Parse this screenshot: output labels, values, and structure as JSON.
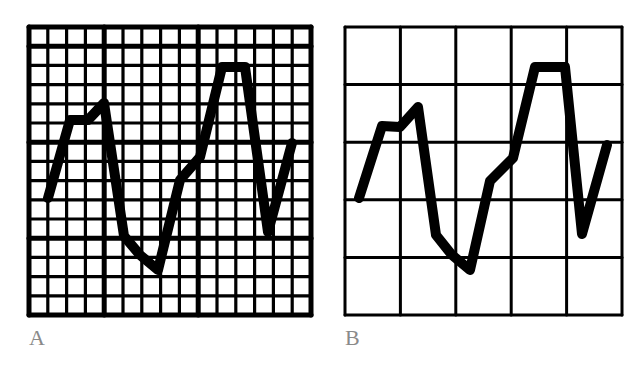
{
  "figure": {
    "panels": [
      {
        "id": "A",
        "label": "A",
        "grid": {
          "x0": 29,
          "y0": 27,
          "x1": 311,
          "y1": 315,
          "cols": 15,
          "rows": 15,
          "heavy_cols": [
            4,
            9
          ],
          "heavy_rows": [
            1,
            6,
            11
          ],
          "line_color": "#000000",
          "line_width": 3.2,
          "heavy_line_width": 5
        },
        "waveform": {
          "color": "#000000",
          "stroke_width": 10,
          "points": [
            [
              48,
              198
            ],
            [
              70,
              120
            ],
            [
              88,
              120
            ],
            [
              104,
              103
            ],
            [
              124,
              236
            ],
            [
              140,
              255
            ],
            [
              158,
              270
            ],
            [
              180,
              180
            ],
            [
              200,
              157
            ],
            [
              222,
              67
            ],
            [
              245,
              67
            ],
            [
              268,
              232
            ],
            [
              292,
              143
            ]
          ]
        }
      },
      {
        "id": "B",
        "label": "B",
        "grid": {
          "x0": 345,
          "y0": 27,
          "x1": 622,
          "y1": 315,
          "cols": 5,
          "rows": 5,
          "heavy_cols": [],
          "heavy_rows": [],
          "line_color": "#000000",
          "line_width": 3,
          "heavy_line_width": 3
        },
        "waveform": {
          "color": "#000000",
          "stroke_width": 10,
          "points": [
            [
              359,
              198
            ],
            [
              382,
              126
            ],
            [
              400,
              127
            ],
            [
              418,
              107
            ],
            [
              436,
              235
            ],
            [
              452,
              255
            ],
            [
              470,
              270
            ],
            [
              490,
              181
            ],
            [
              513,
              158
            ],
            [
              535,
              67
            ],
            [
              565,
              67
            ],
            [
              582,
              234
            ],
            [
              607,
              145
            ]
          ]
        }
      }
    ]
  },
  "labels": {
    "a": "A",
    "b": "B"
  },
  "chart_data": {
    "type": "line",
    "title": "",
    "series": [
      {
        "name": "A",
        "grid_cols": 15,
        "grid_rows": 15,
        "points_grid_units": [
          [
            0.7,
            6.0
          ],
          [
            1.5,
            3.3
          ],
          [
            2.1,
            3.3
          ],
          [
            2.6,
            2.7
          ],
          [
            3.4,
            7.3
          ],
          [
            3.9,
            8.0
          ],
          [
            4.6,
            8.5
          ],
          [
            5.3,
            5.4
          ],
          [
            6.0,
            4.5
          ],
          [
            6.7,
            1.4
          ],
          [
            7.5,
            1.4
          ],
          [
            8.4,
            7.1
          ],
          [
            9.3,
            4.0
          ]
        ]
      },
      {
        "name": "B",
        "grid_cols": 5,
        "grid_rows": 5,
        "points_grid_units": [
          [
            0.25,
            2.95
          ],
          [
            0.66,
            1.72
          ],
          [
            0.99,
            1.73
          ],
          [
            1.32,
            1.39
          ],
          [
            1.64,
            3.6
          ],
          [
            1.93,
            3.95
          ],
          [
            2.25,
            4.2
          ],
          [
            2.61,
            2.67
          ],
          [
            3.03,
            2.27
          ],
          [
            3.42,
            0.69
          ],
          [
            3.96,
            0.69
          ],
          [
            4.27,
            3.64
          ],
          [
            4.72,
            2.05
          ]
        ]
      }
    ],
    "legend": [
      "A",
      "B"
    ],
    "grid": true
  }
}
